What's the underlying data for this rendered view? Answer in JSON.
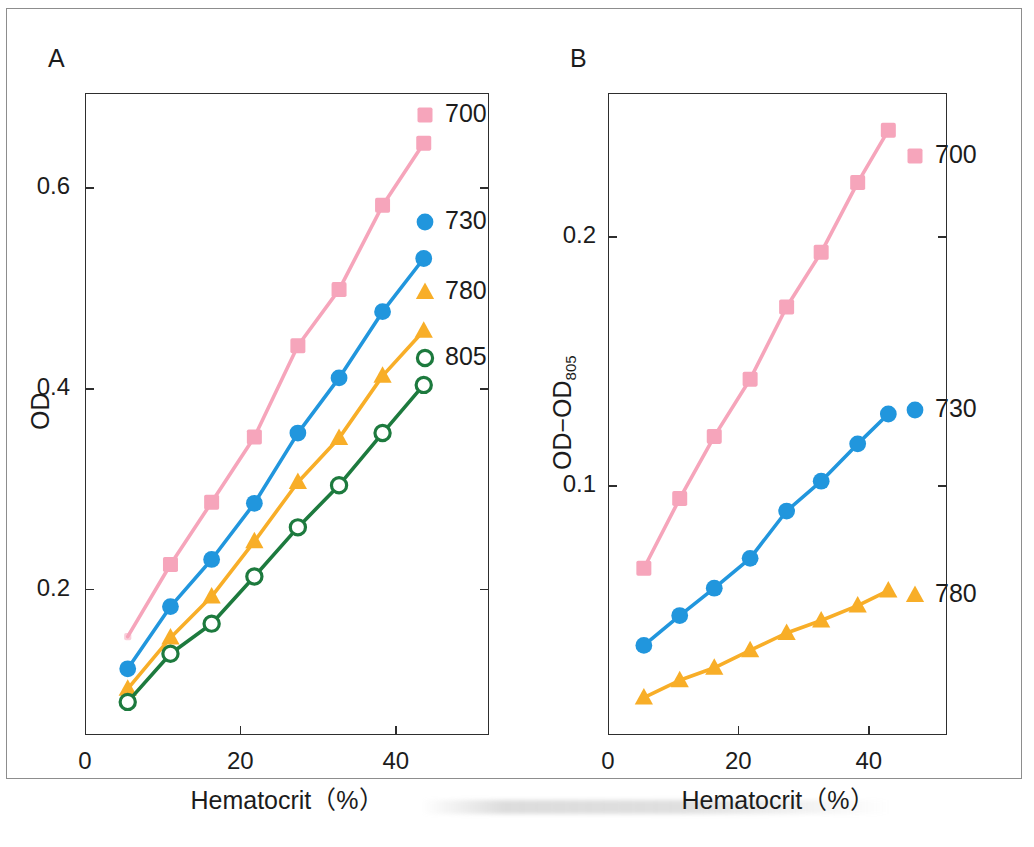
{
  "figure": {
    "panels": [
      {
        "letter": "A",
        "xlabel": "Hematocrit（%）",
        "ylabel": "OD",
        "ylabel_sub": "",
        "xticks": [
          "0",
          "20",
          "40"
        ],
        "yticks": [
          "0.2",
          "0.4",
          "0.6"
        ]
      },
      {
        "letter": "B",
        "xlabel": "Hematocrit（%）",
        "ylabel": "OD−OD",
        "ylabel_sub": "805",
        "xticks": [
          "0",
          "20",
          "40"
        ],
        "yticks": [
          "0.1",
          "0.2"
        ]
      }
    ]
  },
  "colors": {
    "pink": "#f6a5bb",
    "blue": "#2196dd",
    "orange": "#f8ae28",
    "green": "#1d7a3e",
    "axis": "#2e2e2e",
    "border": "#8d8d8d"
  },
  "chart_data": [
    {
      "type": "line",
      "panel": "A",
      "title": "",
      "xlabel": "Hematocrit（%）",
      "ylabel": "OD",
      "xlim": [
        0,
        52
      ],
      "ylim": [
        0.055,
        0.695
      ],
      "xticks": [
        0,
        20,
        40
      ],
      "yticks": [
        0.2,
        0.4,
        0.6
      ],
      "grid": false,
      "legend_position": "right-inside",
      "x": [
        5.5,
        11.0,
        16.3,
        21.8,
        27.4,
        32.7,
        38.3,
        43.6
      ],
      "series": [
        {
          "name": "700",
          "marker": "square",
          "color": "#f6a5bb",
          "filled": true,
          "values": [
            0.153,
            0.225,
            0.287,
            0.352,
            0.443,
            0.499,
            0.583,
            0.645
          ]
        },
        {
          "name": "730",
          "marker": "circle",
          "color": "#2196dd",
          "filled": true,
          "values": [
            0.121,
            0.183,
            0.23,
            0.286,
            0.356,
            0.411,
            0.477,
            0.53
          ]
        },
        {
          "name": "780",
          "marker": "triangle",
          "color": "#f8ae28",
          "filled": true,
          "values": [
            0.101,
            0.152,
            0.193,
            0.248,
            0.307,
            0.351,
            0.413,
            0.458
          ]
        },
        {
          "name": "805",
          "marker": "circle",
          "color": "#1d7a3e",
          "filled": false,
          "values": [
            0.088,
            0.136,
            0.166,
            0.213,
            0.262,
            0.304,
            0.356,
            0.404
          ]
        }
      ]
    },
    {
      "type": "line",
      "panel": "B",
      "title": "",
      "xlabel": "Hematocrit（%）",
      "ylabel": "OD−OD805",
      "xlim": [
        0,
        52
      ],
      "ylim": [
        0.0,
        0.258
      ],
      "xticks": [
        0,
        20,
        40
      ],
      "yticks": [
        0.1,
        0.2
      ],
      "grid": false,
      "legend_position": "right-inside",
      "x": [
        5.5,
        11.0,
        16.3,
        21.8,
        27.4,
        32.7,
        38.3,
        43.0
      ],
      "series": [
        {
          "name": "700",
          "marker": "square",
          "color": "#f6a5bb",
          "filled": true,
          "values": [
            0.067,
            0.095,
            0.12,
            0.143,
            0.172,
            0.194,
            0.222,
            0.243
          ]
        },
        {
          "name": "730",
          "marker": "circle",
          "color": "#2196dd",
          "filled": true,
          "values": [
            0.036,
            0.048,
            0.059,
            0.071,
            0.09,
            0.102,
            0.117,
            0.129
          ]
        },
        {
          "name": "780",
          "marker": "triangle",
          "color": "#f8ae28",
          "filled": true,
          "values": [
            0.015,
            0.022,
            0.027,
            0.034,
            0.041,
            0.046,
            0.052,
            0.058
          ]
        }
      ]
    }
  ],
  "legends": {
    "panelA": [
      {
        "label": "700",
        "marker": "square",
        "color": "#f6a5bb",
        "filled": true
      },
      {
        "label": "730",
        "marker": "circle",
        "color": "#2196dd",
        "filled": true
      },
      {
        "label": "780",
        "marker": "triangle",
        "color": "#f8ae28",
        "filled": true
      },
      {
        "label": "805",
        "marker": "circle",
        "color": "#1d7a3e",
        "filled": false
      }
    ],
    "panelB": [
      {
        "label": "700",
        "marker": "square",
        "color": "#f6a5bb",
        "filled": true
      },
      {
        "label": "730",
        "marker": "circle",
        "color": "#2196dd",
        "filled": true
      },
      {
        "label": "780",
        "marker": "triangle",
        "color": "#f8ae28",
        "filled": true
      }
    ]
  }
}
